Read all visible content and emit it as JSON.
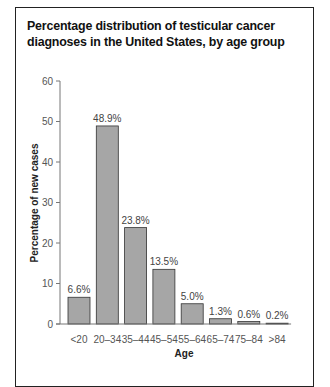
{
  "chart_data": {
    "type": "bar",
    "title": "Percentage distribution of testicular cancer diagnoses in the United States, by age group",
    "xlabel": "Age",
    "ylabel": "Percentage of new cases",
    "ylim": [
      0,
      60
    ],
    "yticks": [
      0,
      10,
      20,
      30,
      40,
      50,
      60
    ],
    "grid": false,
    "legend": "none",
    "categories": [
      "<20",
      "20–34",
      "35–44",
      "45–54",
      "55–64",
      "65–74",
      "75–84",
      ">84"
    ],
    "values": [
      6.6,
      48.9,
      23.8,
      13.5,
      5.0,
      1.3,
      0.6,
      0.2
    ],
    "data_labels": [
      "6.6%",
      "48.9%",
      "23.8%",
      "13.5%",
      "5.0%",
      "1.3%",
      "0.6%",
      "0.2%"
    ],
    "bar_color": "#a6a6a6",
    "bar_edge_color": "#333333"
  }
}
